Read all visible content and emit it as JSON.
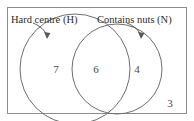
{
  "diagram": {
    "type": "venn-two-set",
    "title": "",
    "universe": {
      "name": "universal-set-rectangle",
      "outside_count": "3"
    },
    "sets": [
      {
        "id": "H",
        "label": "Hard centre (H)",
        "only_count": "7"
      },
      {
        "id": "N",
        "label": "Contains nuts (N)",
        "only_count": "4"
      }
    ],
    "intersection": {
      "label": "H ∩ N",
      "count": "6"
    },
    "colors": {
      "border": "#8c8c8c",
      "circle_stroke": "#6e6e6e",
      "text": "#2b2b2b",
      "number": "#4a4a4a",
      "background": "#ffffff"
    }
  }
}
